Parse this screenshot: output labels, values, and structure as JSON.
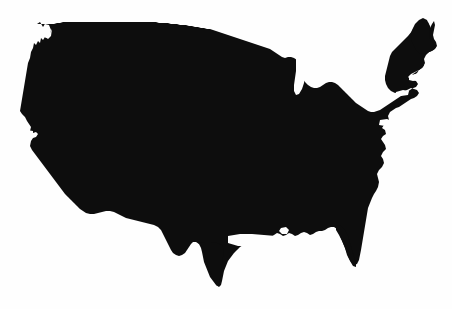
{
  "figure": {
    "name": "united-states-silhouette-map",
    "alt_text": "Solid black silhouette of the contiguous United States on a white background",
    "caption": "",
    "width_px": 452,
    "height_px": 309
  },
  "colors": {
    "background": "#fefefe",
    "landmass": "#0d0d0d",
    "water": "#fefefe"
  },
  "map_data": {
    "type": "silhouette",
    "region": "Contiguous United States",
    "projection_note": "stylized / hand-traced outline",
    "style": "solid filled silhouette, no borders, no labels",
    "bounding_box_px": {
      "left": 20,
      "top": 20,
      "right": 437,
      "bottom": 287
    },
    "features": [
      {
        "name": "Pacific Northwest coast",
        "note": "Olympic Peninsula notch near top-left"
      },
      {
        "name": "California coast",
        "note": "diagonal southwest-trending shoreline with small bay notch"
      },
      {
        "name": "Northern border",
        "note": "near-straight line sloping gently downward west to east"
      },
      {
        "name": "Great Lakes",
        "note": "jagged northern edge; Lake Michigan rendered as white cutout"
      },
      {
        "name": "New England",
        "note": "Maine projects to the upper-right extreme of the shape"
      },
      {
        "name": "Cape Cod",
        "note": "small hooked peninsula on the Atlantic coast"
      },
      {
        "name": "Chesapeake Bay",
        "note": "notch in the mid-Atlantic shoreline"
      },
      {
        "name": "Outer Banks / Carolina coast",
        "note": "small seaward protrusion"
      },
      {
        "name": "Florida peninsula",
        "note": "narrow southward projection, lowest point on the east side"
      },
      {
        "name": "Gulf Coast",
        "note": "irregular edge including Mississippi Delta"
      },
      {
        "name": "Texas",
        "note": "southern tip is the lowest point of the silhouette"
      }
    ],
    "labels": [],
    "legend": [],
    "annotations": []
  }
}
